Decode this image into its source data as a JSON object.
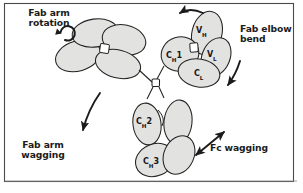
{
  "figure": {
    "background_color": "#fefefe",
    "domain_fill_color": "#e2e2e0",
    "outline_color": "#222222",
    "text_color": "#1b1b1b",
    "border_color": "#4a4a4a"
  },
  "callouts": [
    {
      "id": "fab-arm-rotation",
      "line1": "Fab arm",
      "line2": "rotation",
      "text": "Fab arm\nrotation",
      "icon": "circular-rotation-arrow-icon"
    },
    {
      "id": "fab-elbow-bend",
      "line1": "Fab elbow",
      "line2": "bend",
      "text": "Fab elbow\nbend",
      "icon": "curved-arrow-icon"
    },
    {
      "id": "fab-arm-wagging",
      "line1": "Fab arm",
      "line2": "wagging",
      "text": "Fab arm\nwagging",
      "icon": "curved-down-arrow-icon"
    },
    {
      "id": "fc-wagging",
      "line1": "Fc wagging",
      "line2": "",
      "text": "Fc wagging",
      "icon": "double-headed-arrow-icon"
    }
  ],
  "domains": [
    {
      "id": "vh",
      "base": "V",
      "sub": "H",
      "suffix": "",
      "label": "VH",
      "region": "fab-right"
    },
    {
      "id": "vl",
      "base": "V",
      "sub": "L",
      "suffix": "",
      "label": "VL",
      "region": "fab-right"
    },
    {
      "id": "ch1",
      "base": "C",
      "sub": "H",
      "suffix": "1",
      "label": "CH1",
      "region": "fab-right"
    },
    {
      "id": "cl",
      "base": "C",
      "sub": "L",
      "suffix": "",
      "label": "CL",
      "region": "fab-right"
    },
    {
      "id": "ch2",
      "base": "C",
      "sub": "H",
      "suffix": "2",
      "label": "CH2",
      "region": "fc"
    },
    {
      "id": "ch3",
      "base": "C",
      "sub": "H",
      "suffix": "3",
      "label": "CH3",
      "region": "fc"
    }
  ],
  "structure": {
    "hinge": "central-hinge-square",
    "arms": [
      "fab-arm-left",
      "fab-arm-right",
      "fc-stem"
    ]
  }
}
